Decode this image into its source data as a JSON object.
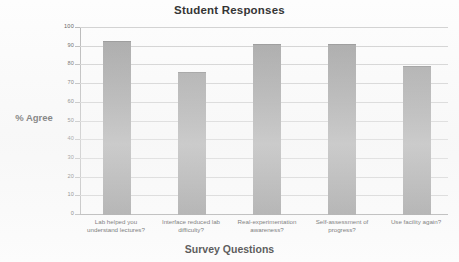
{
  "chart_data": {
    "type": "bar",
    "title": "Student Responses",
    "xlabel": "Survey Questions",
    "ylabel": "% Agree",
    "categories": [
      "Lab helped you understand lectures?",
      "Interface reduced lab difficulty?",
      "Real-experimentation awareness?",
      "Self-assessment of progress?",
      "Use facility again?"
    ],
    "values": [
      92.5,
      76,
      91,
      91,
      79
    ],
    "ylim": [
      0,
      100
    ],
    "ytick_labels": [
      "100",
      "90",
      "80",
      "70",
      "60",
      "50",
      "40",
      "30",
      "20",
      "10",
      "0"
    ],
    "ytick_values": [
      100,
      90,
      80,
      70,
      60,
      50,
      40,
      30,
      20,
      10,
      0
    ],
    "grid": true,
    "legend": "none",
    "bar_color": "#9a9a9a",
    "grid_color": "#cfcfcf",
    "axis_color": "#b4b4b4"
  },
  "axis_labels": {
    "y_title": "% Agree",
    "x_title": "Survey Questions"
  },
  "title": "Student Responses",
  "categories_wrapped": [
    {
      "line1": "Lab helped you",
      "line2": "understand lectures?"
    },
    {
      "line1": "Interface reduced lab",
      "line2": "difficulty?"
    },
    {
      "line1": "Real-experimentation",
      "line2": "awareness?"
    },
    {
      "line1": "Self-assessment of",
      "line2": "progress?"
    },
    {
      "line1": "Use facility again?",
      "line2": ""
    }
  ],
  "ticks": [
    {
      "label": "100"
    },
    {
      "label": "90"
    },
    {
      "label": "80"
    },
    {
      "label": "70"
    },
    {
      "label": "60"
    },
    {
      "label": "50"
    },
    {
      "label": "40"
    },
    {
      "label": "30"
    },
    {
      "label": "20"
    },
    {
      "label": "10"
    },
    {
      "label": "0"
    }
  ]
}
